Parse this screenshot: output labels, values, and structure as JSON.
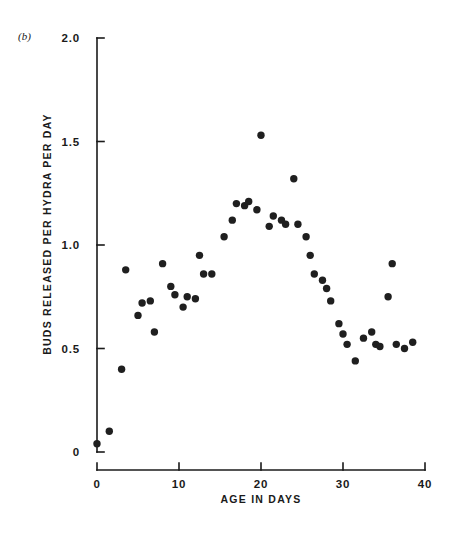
{
  "figure": {
    "panel_label": "(b)",
    "background_color": "#ffffff",
    "marker_color": "#1f1f1f",
    "axis_color": "#1a1a1a"
  },
  "chart_data": {
    "type": "scatter",
    "title": "",
    "panel": "(b)",
    "xlabel": "AGE IN DAYS",
    "ylabel": "BUDS RELEASED PER HYDRA PER DAY",
    "xlim": [
      0,
      40
    ],
    "ylim": [
      0,
      2.0
    ],
    "xticks": [
      0,
      10,
      20,
      30,
      40
    ],
    "xtick_labels": [
      "0",
      "10",
      "20",
      "30",
      "40"
    ],
    "yticks": [
      0,
      0.5,
      1.0,
      1.5,
      2.0
    ],
    "ytick_labels": [
      "0",
      "0.5",
      "1.0",
      "1.5",
      "2.0"
    ],
    "grid": false,
    "legend": null,
    "marker": "filled-circle",
    "axis_style": "offset-spines",
    "x": [
      0.0,
      1.5,
      3.0,
      3.5,
      5.0,
      5.5,
      6.5,
      7.0,
      8.0,
      9.0,
      9.5,
      10.5,
      11.0,
      12.0,
      12.5,
      13.0,
      14.0,
      15.5,
      16.5,
      17.0,
      18.0,
      18.5,
      19.5,
      20.0,
      21.0,
      21.5,
      22.5,
      23.0,
      24.0,
      24.5,
      25.5,
      26.0,
      26.5,
      27.5,
      28.0,
      28.5,
      29.5,
      30.0,
      30.5,
      31.5,
      32.5,
      33.5,
      34.0,
      34.5,
      35.5,
      36.0,
      36.5,
      37.5,
      38.5
    ],
    "y": [
      0.04,
      0.1,
      0.4,
      0.88,
      0.66,
      0.72,
      0.73,
      0.58,
      0.91,
      0.8,
      0.76,
      0.7,
      0.75,
      0.74,
      0.95,
      0.86,
      0.86,
      1.04,
      1.12,
      1.2,
      1.19,
      1.21,
      1.17,
      1.53,
      1.09,
      1.14,
      1.12,
      1.1,
      1.32,
      1.1,
      1.04,
      0.95,
      0.86,
      0.83,
      0.79,
      0.73,
      0.62,
      0.57,
      0.52,
      0.44,
      0.55,
      0.58,
      0.52,
      0.51,
      0.75,
      0.91,
      0.52,
      0.5,
      0.53
    ],
    "n_points": 49
  },
  "geometry": {
    "x0_px": 97,
    "x40_px": 425,
    "y0_px": 452,
    "y2_px": 38,
    "axis_gap_px": 18
  }
}
